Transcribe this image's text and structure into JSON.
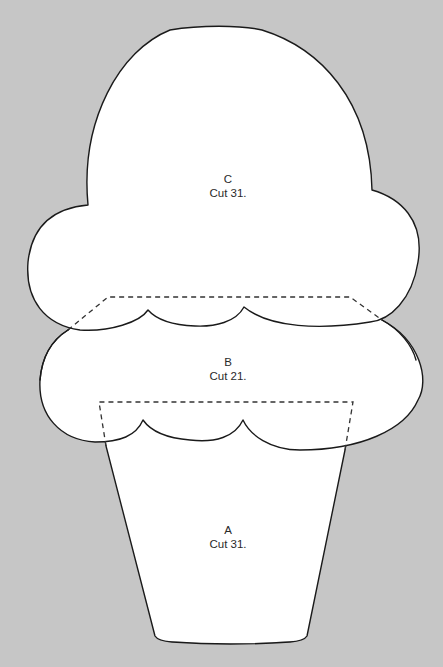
{
  "diagram": {
    "background_color": "#c6c6c6",
    "piece_color": "#ffffff",
    "outline_color": "#1a1a1a",
    "pieces": [
      {
        "id": "C",
        "letter": "C",
        "instruction": "Cut 31.",
        "part": "top scoop"
      },
      {
        "id": "B",
        "letter": "B",
        "instruction": "Cut 21.",
        "part": "middle scoop"
      },
      {
        "id": "A",
        "letter": "A",
        "instruction": "Cut 31.",
        "part": "cone"
      }
    ]
  }
}
